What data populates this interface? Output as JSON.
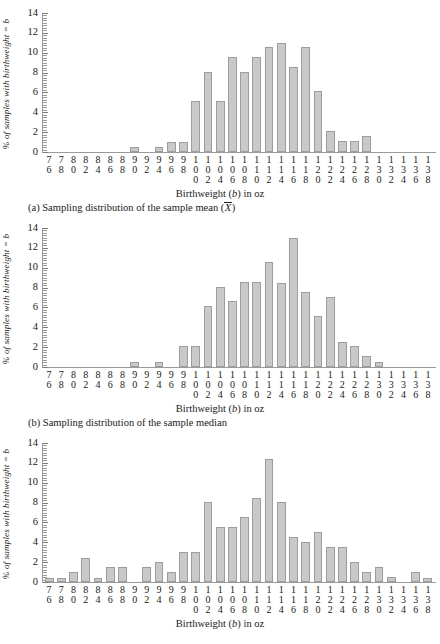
{
  "figure": {
    "ylabel_prefix": "% of samples with birthweight = ",
    "ylabel_var": "b",
    "xtitle_prefix": "Birthweight (",
    "xtitle_var": "b",
    "xtitle_suffix": ") in oz",
    "bar_color": "#c9c9c9",
    "bar_border": "#9d9d9d",
    "axis_color": "#9a9a9a"
  },
  "panels": [
    {
      "caption_prefix": "(a) Sampling distribution of the sample mean (",
      "caption_var": "X",
      "caption_suffix": ")",
      "chart_data": {
        "type": "bar",
        "title": "(a) Sampling distribution of the sample mean (X̄)",
        "xlabel": "Birthweight (b) in oz",
        "ylabel": "% of samples with birthweight = b",
        "ylim": [
          0,
          14
        ],
        "yticks": [
          0,
          2,
          4,
          6,
          8,
          10,
          12,
          14
        ],
        "grid": false,
        "legend": "none",
        "categories": [
          76,
          78,
          80,
          82,
          84,
          86,
          88,
          90,
          92,
          94,
          96,
          98,
          100,
          102,
          104,
          106,
          108,
          110,
          112,
          114,
          116,
          118,
          120,
          122,
          124,
          126,
          128,
          130,
          132,
          134,
          136,
          138
        ],
        "values": [
          0,
          0,
          0,
          0,
          0,
          0,
          0,
          0.5,
          0,
          0.5,
          1.0,
          1.0,
          5.1,
          8.1,
          5.1,
          9.6,
          8.1,
          9.6,
          10.6,
          11.0,
          8.6,
          10.6,
          6.1,
          2.1,
          1.1,
          1.1,
          1.6,
          0,
          0,
          0,
          0,
          0
        ]
      }
    },
    {
      "caption_prefix": "(b) Sampling distribution of the sample median",
      "caption_var": "",
      "caption_suffix": "",
      "chart_data": {
        "type": "bar",
        "title": "(b) Sampling distribution of the sample median",
        "xlabel": "Birthweight (b) in oz",
        "ylabel": "% of samples with birthweight = b",
        "ylim": [
          0,
          14
        ],
        "yticks": [
          0,
          2,
          4,
          6,
          8,
          10,
          12,
          14
        ],
        "grid": false,
        "legend": "none",
        "categories": [
          76,
          78,
          80,
          82,
          84,
          86,
          88,
          90,
          92,
          94,
          96,
          98,
          100,
          102,
          104,
          106,
          108,
          110,
          112,
          114,
          116,
          118,
          120,
          122,
          124,
          126,
          128,
          130,
          132,
          134,
          136,
          138
        ],
        "values": [
          0,
          0,
          0,
          0,
          0,
          0,
          0,
          0.5,
          0,
          0.5,
          0,
          2.1,
          2.1,
          6.1,
          8.1,
          6.6,
          8.6,
          8.6,
          10.6,
          8.5,
          13.0,
          7.6,
          5.1,
          7.1,
          2.5,
          2.1,
          1.1,
          0.5,
          0,
          0,
          0,
          0
        ]
      }
    },
    {
      "caption_prefix": "",
      "caption_var": "",
      "caption_suffix": "",
      "chart_data": {
        "type": "bar",
        "title": "",
        "xlabel": "Birthweight (b) in oz",
        "ylabel": "% of samples with birthweight = b",
        "ylim": [
          0,
          14
        ],
        "yticks": [
          0,
          2,
          4,
          6,
          8,
          10,
          12,
          14
        ],
        "grid": false,
        "legend": "none",
        "categories": [
          76,
          78,
          80,
          82,
          84,
          86,
          88,
          90,
          92,
          94,
          96,
          98,
          100,
          102,
          104,
          106,
          108,
          110,
          112,
          114,
          116,
          118,
          120,
          122,
          124,
          126,
          128,
          130,
          132,
          134,
          136,
          138
        ],
        "values": [
          0.4,
          0.4,
          1.0,
          2.4,
          0.4,
          1.5,
          1.5,
          0,
          1.5,
          2.0,
          1.0,
          3.0,
          3.0,
          8.1,
          5.5,
          5.5,
          6.5,
          8.5,
          12.4,
          8.1,
          4.5,
          4.0,
          5.0,
          3.5,
          3.5,
          2.0,
          1.0,
          1.5,
          0.5,
          0,
          1.0,
          0.4
        ]
      }
    }
  ]
}
